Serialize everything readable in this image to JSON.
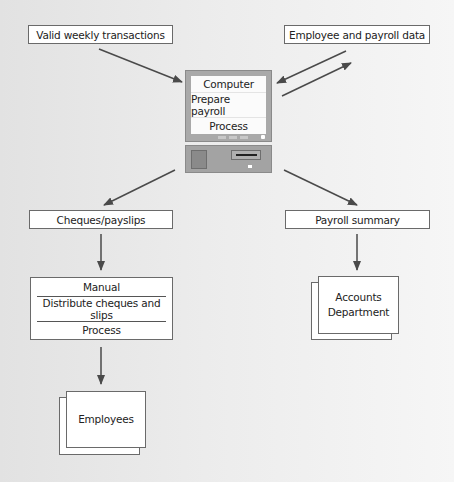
{
  "diagram": {
    "inputs": {
      "transactions": "Valid weekly transactions",
      "employee_data": "Employee and payroll data"
    },
    "computer": {
      "rows": [
        "Computer",
        "Prepare payroll",
        "Process"
      ]
    },
    "outputs": {
      "cheques": "Cheques/payslips",
      "summary": "Payroll summary"
    },
    "manual_process": {
      "rows": [
        "Manual",
        "Distribute cheques and slips",
        "Process"
      ]
    },
    "destinations": {
      "employees": "Employees",
      "accounts_line1": "Accounts",
      "accounts_line2": "Department"
    },
    "colors": {
      "arrow": "#4a4a4a",
      "box_border": "#6a6a6a",
      "computer_body": "#a9a9a9"
    }
  }
}
